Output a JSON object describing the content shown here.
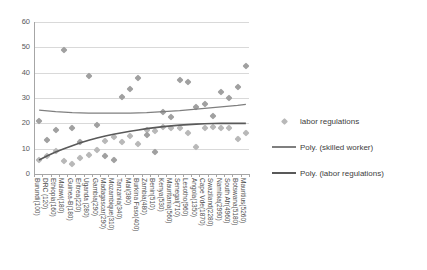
{
  "chart_data": {
    "type": "scatter",
    "title": "",
    "xlabel": "",
    "ylabel": "",
    "ylim": [
      0,
      60
    ],
    "yticks": [
      0,
      10,
      20,
      30,
      40,
      50,
      60
    ],
    "grid": true,
    "legend_position": "right",
    "categories": [
      "Burundi(100)",
      "DRC (120)",
      "Ethiopia(160)",
      "Malawi(180)",
      "Guinea-B(180)",
      "Eritrea(220)",
      "Uganda (280)",
      "Gambia(290)",
      "Madagascar(290)",
      "Mozambique(310)",
      "Tanzania(340)",
      "Mali(380)",
      "Burkina Faso(400)",
      "Zambia(480)",
      "Benin(510)",
      "Kenya(530)",
      "Mauritania(560)",
      "Senegal(710)",
      "Lesotho(960)",
      "Angola(1350)",
      "Cape Vde(1870)",
      "Swaziland(2280)",
      "Namibia(2990)",
      "South Afr(4960)",
      "Botswana(5180)",
      "Mauritius(5260)"
    ],
    "series": [
      {
        "name": "labor regulations",
        "type": "scatter",
        "marker": "diamond",
        "color": "#a0a0a0",
        "values": [
          21,
          13.5,
          17.5,
          49,
          18,
          12.5,
          38.5,
          19.5,
          7,
          5.5,
          30.5,
          33.5,
          38,
          15.5,
          8.5,
          24.5,
          22.5,
          37,
          36.5,
          26.5,
          27.5,
          23,
          32.5,
          30,
          34.5,
          42.5
        ]
      },
      {
        "name": "skilled worker",
        "type": "scatter",
        "marker": "diamond",
        "color": "#b8b8b8",
        "values": [
          5.5,
          7,
          9,
          5,
          4,
          6.5,
          7.5,
          9.5,
          13,
          14.5,
          12.5,
          15,
          12,
          17.5,
          17,
          18.5,
          18,
          18,
          16,
          10.5,
          18,
          18.5,
          18,
          18,
          14,
          16
        ]
      },
      {
        "name": "Poly. (skilled worker)",
        "type": "line",
        "color": "#7f7f7f",
        "values": [
          25.2,
          24.9,
          24.6,
          24.4,
          24.2,
          24.1,
          24.0,
          24.0,
          24.0,
          24.0,
          24.0,
          24.0,
          24.1,
          24.2,
          24.4,
          24.6,
          24.8,
          25.0,
          25.3,
          25.6,
          25.9,
          26.2,
          26.5,
          26.8,
          27.1,
          27.5
        ]
      },
      {
        "name": "Poly. (labor regulations)",
        "type": "line",
        "color": "#595959",
        "values": [
          5.5,
          7.2,
          8.7,
          10.0,
          11.2,
          12.3,
          13.3,
          14.2,
          15.0,
          15.7,
          16.3,
          16.9,
          17.4,
          17.9,
          18.3,
          18.7,
          19.0,
          19.3,
          19.5,
          19.7,
          19.85,
          19.95,
          20.0,
          20.0,
          20.0,
          20.0
        ]
      }
    ],
    "legend": [
      {
        "label": "labor regulations",
        "key": "diamond-marker"
      },
      {
        "label": "Poly. (skilled worker)",
        "key": "line-light"
      },
      {
        "label": "Poly. (labor regulations)",
        "key": "line-dark"
      }
    ]
  }
}
